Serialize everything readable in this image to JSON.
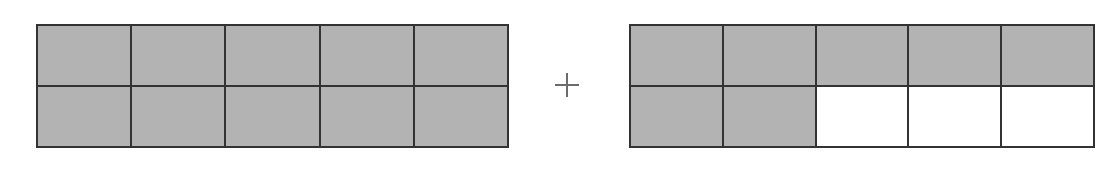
{
  "diagram": {
    "type": "fraction-area-model-addition",
    "operator": "+",
    "colors": {
      "shaded": "#b3b3b3",
      "unshaded": "#ffffff",
      "border": "#333333",
      "operator": "#6b6b6b"
    },
    "models": [
      {
        "name": "left",
        "rows": 2,
        "cols": 5,
        "total_cells": 10,
        "shaded_cells": 10,
        "cells": [
          1,
          1,
          1,
          1,
          1,
          1,
          1,
          1,
          1,
          1
        ]
      },
      {
        "name": "right",
        "rows": 2,
        "cols": 5,
        "total_cells": 10,
        "shaded_cells": 7,
        "cells": [
          1,
          1,
          1,
          1,
          1,
          1,
          1,
          0,
          0,
          0
        ]
      }
    ]
  }
}
